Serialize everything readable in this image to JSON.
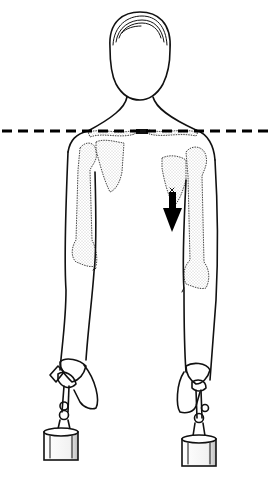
{
  "figure": {
    "width": 271,
    "height": 477,
    "background": "#ffffff",
    "ink_color": "#111111",
    "bone_stipple_color": "#9a9a9a",
    "reference_line": {
      "style": "dashed",
      "y": 131,
      "x1": 2,
      "x2": 269,
      "color": "#000000",
      "meaning": "horizontal shoulder reference"
    },
    "arrow": {
      "direction": "down",
      "side": "right-of-image (subject's left shoulder)",
      "x": 172,
      "y_top": 188,
      "y_bottom": 232,
      "color": "#000000"
    },
    "weights": [
      {
        "side": "left",
        "x": 43,
        "y": 430,
        "w": 34,
        "h": 30
      },
      {
        "side": "right",
        "x": 182,
        "y": 437,
        "w": 34,
        "h": 30
      }
    ]
  }
}
